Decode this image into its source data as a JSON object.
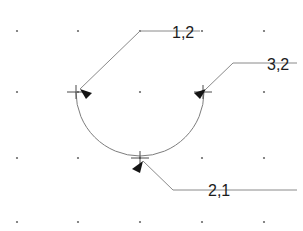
{
  "diagram": {
    "background_color": "#ffffff",
    "line_color": "#8a8a8a",
    "arc_color": "#7d7d7d",
    "text_color": "#1c1c1c",
    "dot_color": "#6a6a6a",
    "grid": {
      "columns_x": [
        17,
        78,
        140,
        202,
        264
      ],
      "rows_y": [
        31,
        92,
        158,
        222
      ],
      "dot_radius": 1.1
    },
    "arc": {
      "center_x": 140,
      "center_y": 92,
      "radius": 64,
      "start_x": 76,
      "start_y": 92,
      "end_x": 204,
      "end_y": 92,
      "sweep": "bottom-half"
    },
    "points": [
      {
        "id": "point-1-2",
        "label": "1,2",
        "marker_x": 76,
        "marker_y": 92,
        "label_x": 172,
        "label_y": 38,
        "leader": "M 200 31 L 140 31 L 80 89",
        "arrow": "M 80 89 L 92 93 L 86 99 Z"
      },
      {
        "id": "point-3-2",
        "label": "3,2",
        "marker_x": 203,
        "marker_y": 92,
        "label_x": 267,
        "label_y": 70,
        "leader": "M 297 63 L 233 63 L 206 89",
        "arrow": "M 206 89 L 194 93 L 200 99 Z"
      },
      {
        "id": "point-2-1",
        "label": "2,1",
        "marker_x": 140,
        "marker_y": 158,
        "label_x": 208,
        "label_y": 196,
        "leader": "M 297 190 L 173 190 L 143 161",
        "arrow": "M 143 161 L 132 169 L 140 173 Z"
      }
    ],
    "cross_marker": {
      "half_width": 9,
      "half_height": 7
    }
  }
}
